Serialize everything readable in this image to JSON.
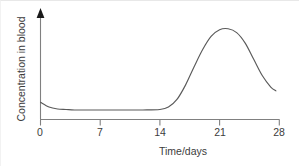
{
  "chart_data": {
    "type": "line",
    "title": "",
    "subtitle": "",
    "xlabel": "Time/days",
    "ylabel": "Concentration in blood",
    "xlim": [
      0,
      28
    ],
    "ylim": [
      0,
      1
    ],
    "grid": false,
    "legend": null,
    "x_ticks": [
      {
        "value": 0,
        "label": "0"
      },
      {
        "value": 7,
        "label": "7"
      },
      {
        "value": 14,
        "label": "14"
      },
      {
        "value": 21,
        "label": "21"
      },
      {
        "value": 28,
        "label": "28"
      }
    ],
    "y_ticks": [],
    "axis_style": {
      "y_axis_arrow": true,
      "y_axis_ticks": false,
      "x_axis_arrow": false,
      "line_color": "#808080",
      "curve_color": "#5a5a5a"
    },
    "annotations": [],
    "series": [
      {
        "name": "Concentration in blood",
        "x": [
          0,
          1,
          2,
          3,
          4,
          6,
          8,
          10,
          12,
          14,
          15,
          16,
          17,
          18,
          19,
          20,
          21,
          22,
          23,
          24,
          25,
          26,
          27,
          27.6
        ],
        "values": [
          0.18,
          0.13,
          0.11,
          0.105,
          0.1,
          0.1,
          0.1,
          0.1,
          0.1,
          0.105,
          0.13,
          0.21,
          0.36,
          0.55,
          0.73,
          0.87,
          0.94,
          0.95,
          0.91,
          0.8,
          0.63,
          0.46,
          0.34,
          0.3
        ]
      }
    ]
  },
  "figure": {
    "xlabel_text": "Time/days",
    "ylabel_text": "Concentration in blood",
    "tick_0": "0",
    "tick_7": "7",
    "tick_14": "14",
    "tick_21": "21",
    "tick_28": "28"
  }
}
